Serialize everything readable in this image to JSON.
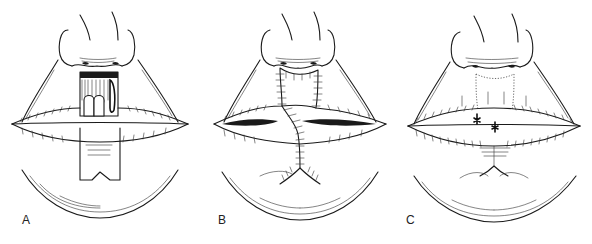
{
  "figure": {
    "panels": [
      {
        "id": "A",
        "label": "A",
        "stage": "flap raised from lower lip and rotated into upper lip defect"
      },
      {
        "id": "B",
        "label": "B",
        "stage": "flap sutured in place with pedicle intact"
      },
      {
        "id": "C",
        "label": "C",
        "stage": "pedicle divided and vermilion healed"
      }
    ],
    "colors": {
      "line": "#1a1a1a",
      "background": "#ffffff"
    }
  }
}
